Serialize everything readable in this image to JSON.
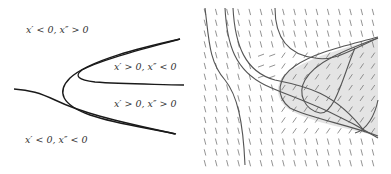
{
  "left_panel": {
    "region_labels": [
      {
        "text": "x′ < 0, x″ > 0",
        "x": 26,
        "y": 24
      },
      {
        "text": "x′ > 0, x″ < 0",
        "x": 114,
        "y": 62
      },
      {
        "text": "x′ > 0, x″ > 0",
        "x": 114,
        "y": 98
      },
      {
        "text": "x′ < 0, x″ < 0",
        "x": 25,
        "y": 134
      }
    ],
    "curves": [
      "outer-parabola-upper",
      "inner-parabola",
      "lower-branch"
    ]
  },
  "right_panel": {
    "type": "slope-field",
    "grid": {
      "cols": 16,
      "rows": 15
    },
    "shaded_region_color": "#e6e6e6",
    "stroke_color": "#555555"
  },
  "colors": {
    "curve": "#1a1a1a",
    "shade": "#e4e4e4",
    "field_tick": "#666666"
  }
}
